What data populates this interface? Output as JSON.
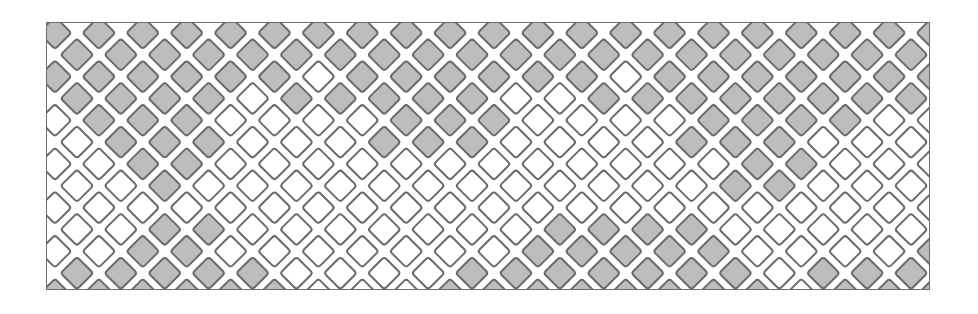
{
  "image": {
    "title": "Diamond lattice decorative pattern",
    "width": 978,
    "height": 314,
    "background_color": "#ffffff"
  },
  "frame": {
    "x": 46,
    "y": 22,
    "width": 884,
    "height": 268,
    "border_color": "#6d6d6d",
    "border_width": 1,
    "fill_color": "#ffffff"
  },
  "pattern": {
    "type": "diamond-lattice",
    "shape": "rotated-square",
    "rotation_degrees": 45,
    "pitch_x": 44,
    "pitch_y": 44,
    "origin_x": 0,
    "origin_y": 0,
    "tile_half_size": 17,
    "tile_corner_radius": 3,
    "outline_color": "#6b6b6b",
    "outline_width": 2,
    "gap_color": "#ffffff",
    "fill_gray": "#bdbdbd",
    "fill_white": "#ffffff",
    "columns": 21,
    "rows": 7,
    "offset_rows": true,
    "legend": {
      "gray_label": "gray tile",
      "white_label": "white tile"
    }
  },
  "chart_data": {
    "type": "heatmap",
    "xlabel": "column",
    "ylabel": "row",
    "categories": [
      "0",
      "1",
      "2",
      "3",
      "4",
      "5",
      "6",
      "7",
      "8",
      "9",
      "10",
      "11",
      "12",
      "13",
      "14",
      "15",
      "16",
      "17",
      "18",
      "19",
      "20"
    ],
    "row_labels": [
      "0",
      "1",
      "2",
      "3",
      "4",
      "5",
      "6"
    ],
    "value_map": {
      "1": "gray",
      "0": "white"
    },
    "grid": [
      [
        1,
        1,
        1,
        1,
        1,
        1,
        1,
        1,
        1,
        1,
        1,
        1,
        1,
        1,
        1,
        1,
        1,
        1,
        1,
        1,
        1
      ],
      [
        1,
        1,
        1,
        1,
        1,
        1,
        0,
        1,
        1,
        1,
        1,
        1,
        1,
        0,
        1,
        1,
        1,
        1,
        1,
        1,
        1
      ],
      [
        0,
        1,
        1,
        1,
        0,
        0,
        0,
        0,
        1,
        1,
        1,
        0,
        0,
        0,
        0,
        1,
        1,
        1,
        1,
        0,
        0
      ],
      [
        0,
        0,
        1,
        1,
        0,
        0,
        0,
        0,
        0,
        0,
        0,
        0,
        0,
        0,
        0,
        0,
        1,
        1,
        0,
        0,
        0
      ],
      [
        0,
        0,
        0,
        0,
        0,
        0,
        0,
        0,
        0,
        0,
        0,
        0,
        0,
        0,
        0,
        0,
        0,
        0,
        0,
        0,
        0
      ],
      [
        0,
        0,
        1,
        1,
        0,
        0,
        0,
        0,
        0,
        0,
        0,
        1,
        1,
        1,
        1,
        1,
        0,
        0,
        0,
        0,
        1
      ],
      [
        1,
        1,
        1,
        1,
        1,
        1,
        0,
        0,
        0,
        1,
        1,
        1,
        1,
        1,
        1,
        1,
        1,
        0,
        1,
        1,
        1
      ]
    ],
    "half_grid": [
      [
        1,
        1,
        1,
        1,
        1,
        1,
        1,
        1,
        1,
        1,
        1,
        1,
        1,
        1,
        1,
        1,
        1,
        1,
        1,
        1
      ],
      [
        1,
        1,
        1,
        1,
        0,
        1,
        1,
        1,
        1,
        1,
        0,
        0,
        1,
        1,
        1,
        1,
        1,
        1,
        1,
        1
      ],
      [
        0,
        1,
        1,
        1,
        0,
        0,
        0,
        1,
        1,
        1,
        0,
        0,
        0,
        0,
        1,
        1,
        1,
        0,
        0,
        0
      ],
      [
        0,
        0,
        1,
        0,
        0,
        0,
        0,
        0,
        0,
        0,
        0,
        0,
        0,
        0,
        0,
        1,
        1,
        0,
        0,
        0
      ],
      [
        0,
        0,
        1,
        1,
        0,
        0,
        0,
        0,
        0,
        0,
        0,
        1,
        1,
        1,
        1,
        0,
        0,
        0,
        0,
        0
      ],
      [
        1,
        1,
        1,
        1,
        1,
        0,
        0,
        0,
        0,
        1,
        1,
        1,
        1,
        1,
        1,
        1,
        0,
        1,
        1,
        1
      ]
    ]
  }
}
